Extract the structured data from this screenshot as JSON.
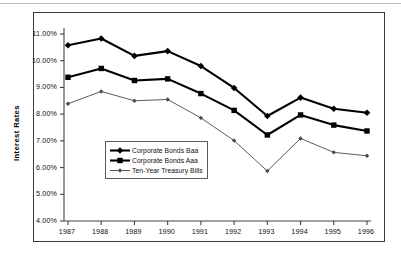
{
  "chart_data": {
    "type": "line",
    "title": "",
    "xlabel": "",
    "ylabel": "Interest  Rates",
    "x": [
      1987,
      1988,
      1989,
      1990,
      1991,
      1992,
      1993,
      1994,
      1995,
      1996
    ],
    "categories": [
      "1987",
      "1988",
      "1989",
      "1990",
      "1991",
      "1992",
      "1993",
      "1994",
      "1995",
      "1996"
    ],
    "ylim": [
      4.0,
      11.0
    ],
    "ytick_values": [
      4.0,
      5.0,
      6.0,
      7.0,
      8.0,
      9.0,
      10.0,
      11.0
    ],
    "ytick_labels": [
      "4.00%",
      "5.00%",
      "6.00%",
      "7.00%",
      "8.00%",
      "9.00%",
      "10.00%",
      "11.00%"
    ],
    "grid": false,
    "legend_position": "lower-left-inside",
    "series": [
      {
        "name": "Corporate Bonds Baa",
        "marker": "diamond",
        "color": "#000000",
        "line_width": 2.1,
        "values": [
          10.58,
          10.83,
          10.18,
          10.36,
          9.8,
          8.98,
          7.93,
          8.62,
          8.2,
          8.05
        ]
      },
      {
        "name": "Corporate Bonds Aaa",
        "marker": "square",
        "color": "#000000",
        "line_width": 2.1,
        "values": [
          9.38,
          9.71,
          9.26,
          9.32,
          8.77,
          8.14,
          7.22,
          7.97,
          7.59,
          7.37
        ]
      },
      {
        "name": "Ten-Year Treasury Bills",
        "marker": "diamond-small",
        "color": "#4a4a4a",
        "line_width": 0.9,
        "values": [
          8.39,
          8.85,
          8.5,
          8.55,
          7.86,
          7.01,
          5.87,
          7.09,
          6.57,
          6.44
        ]
      }
    ]
  }
}
